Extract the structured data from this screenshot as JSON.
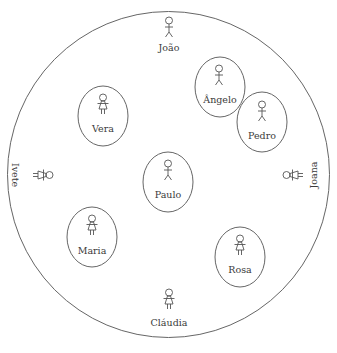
{
  "diagram": {
    "type": "social-group-membership",
    "outer_boundary": {
      "cx": 168.5,
      "cy": 174.5,
      "rx": 161,
      "ry": 163,
      "color": "#666666"
    },
    "people": [
      {
        "id": "joao",
        "name": "João",
        "gender": "male",
        "x": 169,
        "y": 30,
        "label_y": 52,
        "circled": false,
        "rotation": 0
      },
      {
        "id": "angelo",
        "name": "Ângelo",
        "gender": "male",
        "x": 219,
        "y": 75,
        "label_y": 103,
        "circled": true,
        "ellipse": {
          "cx": 220,
          "cy": 87,
          "rx": 25,
          "ry": 30
        },
        "rotation": 0
      },
      {
        "id": "pedro",
        "name": "Pedro",
        "gender": "male",
        "x": 262,
        "y": 111,
        "label_y": 139,
        "circled": true,
        "ellipse": {
          "cx": 262,
          "cy": 122,
          "rx": 25,
          "ry": 30
        },
        "rotation": 0
      },
      {
        "id": "vera",
        "name": "Vera",
        "gender": "female",
        "x": 103,
        "y": 104,
        "label_y": 132,
        "circled": true,
        "ellipse": {
          "cx": 103,
          "cy": 116,
          "rx": 25,
          "ry": 30
        },
        "rotation": 0
      },
      {
        "id": "paulo",
        "name": "Paulo",
        "gender": "male",
        "x": 168,
        "y": 171,
        "label_y": 199,
        "circled": true,
        "ellipse": {
          "cx": 168,
          "cy": 182,
          "rx": 25,
          "ry": 30
        },
        "rotation": 0
      },
      {
        "id": "maria",
        "name": "Maria",
        "gender": "female",
        "x": 92,
        "y": 226,
        "label_y": 254,
        "circled": true,
        "ellipse": {
          "cx": 92,
          "cy": 237,
          "rx": 25,
          "ry": 30
        },
        "rotation": 0
      },
      {
        "id": "rosa",
        "name": "Rosa",
        "gender": "female",
        "x": 240,
        "y": 246,
        "label_y": 274,
        "circled": true,
        "ellipse": {
          "cx": 240,
          "cy": 257,
          "rx": 25,
          "ry": 30
        },
        "rotation": 0
      },
      {
        "id": "claudia",
        "name": "Cláudia",
        "gender": "female",
        "x": 169,
        "y": 299,
        "label_y": 327,
        "circled": false,
        "rotation": 0
      },
      {
        "id": "ivete",
        "name": "Ivete",
        "gender": "female",
        "x": 43,
        "y": 175,
        "label_x": 15,
        "circled": false,
        "rotation": -90
      },
      {
        "id": "joana",
        "name": "Joana",
        "gender": "female",
        "x": 291,
        "y": 175,
        "label_x": 320,
        "circled": false,
        "rotation": 90
      }
    ]
  },
  "labels": {
    "joao": "João",
    "angelo": "Ângelo",
    "pedro": "Pedro",
    "vera": "Vera",
    "paulo": "Paulo",
    "maria": "Maria",
    "rosa": "Rosa",
    "claudia": "Cláudia",
    "ivete": "Ivete",
    "joana": "Joana"
  }
}
